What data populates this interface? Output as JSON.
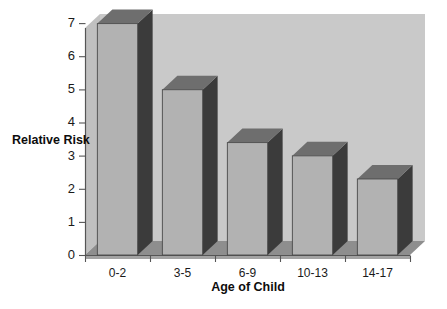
{
  "chart_data": {
    "type": "bar",
    "title": "",
    "subtitle": "",
    "xlabel": "Age of Child",
    "ylabel": "Relative Risk",
    "categories": [
      "0-2",
      "3-5",
      "6-9",
      "10-13",
      "14-17"
    ],
    "values": [
      7.0,
      5.0,
      3.4,
      3.0,
      2.3
    ],
    "series": [
      {
        "name": "Relative Risk",
        "values": [
          7.0,
          5.0,
          3.4,
          3.0,
          2.3
        ]
      }
    ],
    "ylim": [
      0,
      7
    ],
    "yticks": [
      0,
      1,
      2,
      3,
      4,
      5,
      6,
      7
    ],
    "ytick_labels": [
      "0",
      "1",
      "2",
      "3",
      "4",
      "5",
      "6",
      "7"
    ],
    "grid": false,
    "legend": false,
    "legend_position": "none",
    "style": "3d-column",
    "colors": {
      "plot_background": "#c9c9c9",
      "floor": "#8e8e8e",
      "bar_front": "#b2b2b2",
      "bar_top": "#6e6e6e",
      "bar_side": "#3b3b3b",
      "axis_line": "#555555",
      "text": "#1a1a1a",
      "page_background": "#ffffff"
    }
  }
}
